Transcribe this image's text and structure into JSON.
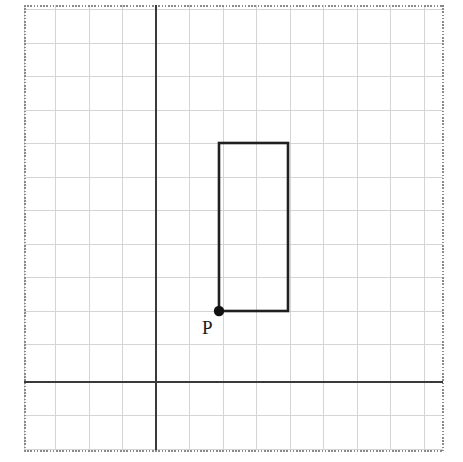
{
  "figure": {
    "width": 463,
    "height": 462,
    "background_color": "#ffffff"
  },
  "border": {
    "name": "dotted-frame",
    "style": "dotted",
    "color": "#8a8a8a",
    "left": 24,
    "top": 5,
    "right": 443,
    "bottom": 450
  },
  "grid": {
    "color": "#d4d4d4",
    "spacing": 33.5,
    "line_width": 1,
    "columns": 12,
    "rows": 13,
    "x_positions": [
      24,
      55.5,
      89,
      122.5,
      156,
      189.5,
      223,
      256.5,
      290,
      323.5,
      357,
      390.5,
      424,
      443
    ],
    "y_positions": [
      5,
      43,
      76.5,
      110,
      143.5,
      177,
      210.5,
      244,
      277.5,
      311,
      344.5,
      378,
      382,
      415.5,
      450
    ]
  },
  "axes": {
    "color": "#3a3a3a",
    "line_width": 2,
    "origin_x": 156,
    "origin_y": 382,
    "x_axis": {
      "label": "",
      "start": 24,
      "end": 443
    },
    "y_axis": {
      "label": "",
      "start": 5,
      "end": 450
    }
  },
  "shapes": [
    {
      "name": "rectangle",
      "type": "rectangle",
      "stroke_color": "#1f1f1f",
      "stroke_width": 2.6,
      "fill": "none",
      "left": 219,
      "top": 143,
      "right": 288,
      "bottom": 311,
      "width_px": 69,
      "height_px": 168,
      "grid_width": 2,
      "grid_height": 5
    }
  ],
  "points": [
    {
      "name": "point-p",
      "label": "P",
      "x": 219,
      "y": 311,
      "marker": "filled-circle",
      "marker_radius": 5,
      "marker_color": "#111111",
      "label_x": 206,
      "label_y": 332,
      "label_color": "#1a1a1a"
    }
  ],
  "colors": {
    "grid_line": "#d4d4d4",
    "axis_line": "#3a3a3a",
    "shape_stroke": "#1f1f1f",
    "frame_dots": "#8a8a8a",
    "point_marker": "#111111",
    "background": "#ffffff"
  }
}
